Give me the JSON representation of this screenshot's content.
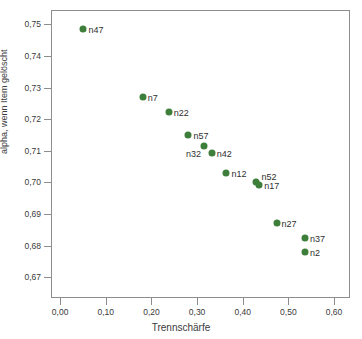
{
  "chart_data": {
    "type": "scatter",
    "title": "",
    "xlabel": "Trennschärfe",
    "ylabel": "alpha, wenn Item gelöscht",
    "xlim": [
      -0.02,
      0.635
    ],
    "ylim": [
      0.6635,
      0.7545
    ],
    "grid": false,
    "legend": null,
    "marker_color": "#3d7f3a",
    "marker_shape": "circle",
    "frame_color": "#8d8d8d",
    "background": "#ffffff",
    "xticks": [
      "0,00",
      "0,10",
      "0,20",
      "0,30",
      "0,40",
      "0,50",
      "0,60"
    ],
    "xtick_values": [
      0.0,
      0.1,
      0.2,
      0.3,
      0.4,
      0.5,
      0.6
    ],
    "yticks": [
      "0,75",
      "0,74",
      "0,73",
      "0,72",
      "0,71",
      "0,70",
      "0,69",
      "0,68",
      "0,67"
    ],
    "ytick_values": [
      0.75,
      0.74,
      0.73,
      0.72,
      0.71,
      0.7,
      0.69,
      0.68,
      0.67
    ],
    "points": [
      {
        "label": "n47",
        "x": 0.049,
        "y": 0.7488,
        "label_side": "right"
      },
      {
        "label": "n7",
        "x": 0.179,
        "y": 0.7272,
        "label_side": "right"
      },
      {
        "label": "n22",
        "x": 0.236,
        "y": 0.7226,
        "label_side": "right"
      },
      {
        "label": "n57",
        "x": 0.279,
        "y": 0.7152,
        "label_side": "right"
      },
      {
        "label": "n32",
        "x": 0.313,
        "y": 0.7118,
        "label_side": "below-left"
      },
      {
        "label": "n42",
        "x": 0.33,
        "y": 0.7097,
        "label_side": "right"
      },
      {
        "label": "n12",
        "x": 0.362,
        "y": 0.7034,
        "label_side": "right"
      },
      {
        "label": "n52",
        "x": 0.426,
        "y": 0.7006,
        "label_side": "above-right"
      },
      {
        "label": "n17",
        "x": 0.434,
        "y": 0.6995,
        "label_side": "right"
      },
      {
        "label": "n27",
        "x": 0.472,
        "y": 0.6874,
        "label_side": "right"
      },
      {
        "label": "n37",
        "x": 0.534,
        "y": 0.6828,
        "label_side": "right"
      },
      {
        "label": "n2",
        "x": 0.534,
        "y": 0.6782,
        "label_side": "right"
      }
    ]
  }
}
